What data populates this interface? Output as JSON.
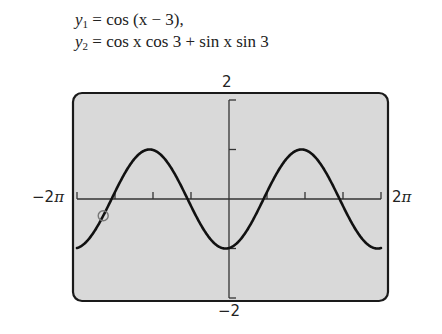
{
  "equations": {
    "y1": {
      "lhs": "y",
      "sub": "1",
      "rhs": " = cos (x − 3),"
    },
    "y2": {
      "lhs": "y",
      "sub": "2",
      "rhs": " = cos x cos 3 + sin x sin 3"
    }
  },
  "window": {
    "xmin_label": "−2",
    "xmax_label": "2",
    "pi_symbol": "π",
    "ymax_label": "2",
    "ymin_label": "−2"
  },
  "colors": {
    "screen_bg": "#d9d9d9",
    "frame": "#1a1a1a",
    "curve": "#111111",
    "axis": "#333333",
    "marker": "#777777"
  },
  "chart_data": {
    "type": "line",
    "xlabel": "",
    "ylabel": "",
    "xlim": [
      -6.2832,
      6.2832
    ],
    "ylim": [
      -2,
      2
    ],
    "x_ticks_step": "π/2",
    "y_ticks": [
      -2,
      -1,
      1,
      2
    ],
    "tick_labels": {
      "x": [
        "−2π",
        "2π"
      ],
      "y": [
        "−2",
        "2"
      ]
    },
    "grid": false,
    "legend": null,
    "series": [
      {
        "name": "y1 = cos(x − 3) (identical to y2)",
        "x": [
          -6.2832,
          -5.4978,
          -4.7124,
          -3.927,
          -3.2832,
          -3.1416,
          -2.3562,
          -1.7124,
          -1.5708,
          -0.7854,
          0,
          0.7854,
          1.5708,
          2.3562,
          3.0,
          3.1416,
          3.927,
          4.7124,
          5.4978,
          6.2832
        ],
        "values": [
          0.96,
          0.539,
          -0.078,
          -0.648,
          1.0,
          0.99,
          0.75,
          0.146,
          0.006,
          -0.469,
          -0.99,
          -0.862,
          -0.223,
          0.569,
          1.0,
          0.99,
          0.612,
          -0.024,
          -0.589,
          -0.99
        ]
      }
    ],
    "annotations": [
      {
        "type": "circle-marker",
        "x": -5.2,
        "y": 0.55
      }
    ]
  }
}
